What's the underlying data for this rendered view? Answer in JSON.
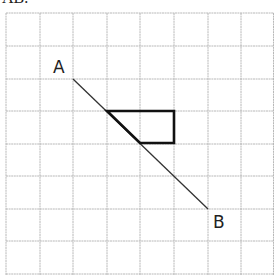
{
  "caption": "AB.",
  "grid": {
    "cols": 8,
    "rows": 8,
    "line_color": "#b5b5b5"
  },
  "points": {
    "A": {
      "label": "A",
      "x": 73,
      "y": 79
    },
    "B": {
      "label": "B",
      "x": 208,
      "y": 209
    }
  },
  "shape": {
    "type": "triangle",
    "stroke": "#111111"
  }
}
